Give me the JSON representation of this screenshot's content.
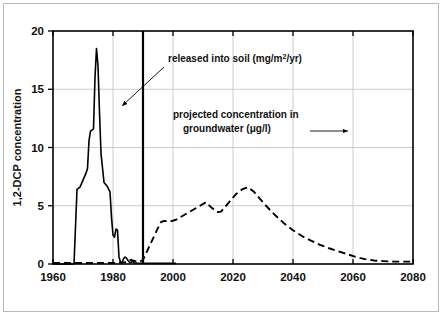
{
  "figure": {
    "background_color": "#ffffff",
    "frame_color": "#b9b9b9",
    "plot_border_color": "#000000",
    "grid_color": "#bfbfbf",
    "series_color": "#000000"
  },
  "chart_data": {
    "type": "line",
    "title": "",
    "xlabel": "",
    "ylabel": "1,2-DCP concentration",
    "xlim": [
      1960,
      2080
    ],
    "ylim": [
      0,
      20
    ],
    "xticks": [
      1960,
      1980,
      2000,
      2020,
      2040,
      2060,
      2080
    ],
    "xtick_labels": [
      "1960",
      "1980",
      "2000",
      "2020",
      "2040",
      "2060",
      "2080"
    ],
    "yticks": [
      0,
      5,
      10,
      15,
      20
    ],
    "ytick_labels": [
      "0",
      "5",
      "10",
      "15",
      "20"
    ],
    "grid": true,
    "grid_axis": "both",
    "legend": "none",
    "series": [
      {
        "name": "released into soil (mg/m2/yr)",
        "style": "solid",
        "linewidth": 1.6,
        "x": [
          1960,
          1966.5,
          1967,
          1967.5,
          1968,
          1969,
          1970,
          1971,
          1971.5,
          1972,
          1972.5,
          1973,
          1973.5,
          1974,
          1974.5,
          1975,
          1975.5,
          1976,
          1977,
          1978,
          1979,
          1979.5,
          1980,
          1980.5,
          1981,
          1981.5,
          1982,
          1982.5,
          1983,
          1983.5,
          1984,
          1984.5,
          1985,
          1985.5,
          1986,
          1986.5,
          1987,
          1988,
          1990,
          1995,
          2000,
          2001
        ],
        "y": [
          0,
          0,
          0,
          3.2,
          6.4,
          6.6,
          7.2,
          7.8,
          8.2,
          10.6,
          11.4,
          11.5,
          11.6,
          16.0,
          18.5,
          17.0,
          13.0,
          9.5,
          7.0,
          6.7,
          6.2,
          4.0,
          2.5,
          2.3,
          3.0,
          2.9,
          0.6,
          0.15,
          0.1,
          0.45,
          0.6,
          0.5,
          0.3,
          0.15,
          0.1,
          0.25,
          0.1,
          0.08,
          0.06,
          0.05,
          0.05,
          0.05
        ]
      },
      {
        "name": "projected concentration in groundwater (ug/l)",
        "style": "dashed",
        "linewidth": 1.9,
        "dash_pattern": "7,4",
        "x": [
          1960,
          1980,
          1984,
          1986,
          1988,
          1989,
          1990,
          1991,
          1993,
          1995,
          1996,
          1997,
          1999,
          2001,
          2003,
          2005,
          2007,
          2009,
          2011,
          2013,
          2015,
          2016,
          2017,
          2019,
          2021,
          2023,
          2025,
          2027,
          2029,
          2031,
          2034,
          2037,
          2040,
          2043,
          2046,
          2049,
          2052,
          2055,
          2058,
          2061,
          2064,
          2067,
          2070,
          2074,
          2078,
          2080
        ],
        "y": [
          0.08,
          0.08,
          0.15,
          0.35,
          0.2,
          0.2,
          0.35,
          0.9,
          2.0,
          3.1,
          3.6,
          3.7,
          3.65,
          3.8,
          4.1,
          4.4,
          4.7,
          5.0,
          5.3,
          4.8,
          4.45,
          4.5,
          4.8,
          5.4,
          6.0,
          6.4,
          6.6,
          6.2,
          5.6,
          5.0,
          4.2,
          3.5,
          2.9,
          2.4,
          2.0,
          1.65,
          1.35,
          1.1,
          0.85,
          0.6,
          0.42,
          0.3,
          0.25,
          0.2,
          0.2,
          0.2
        ]
      }
    ],
    "annotations": [
      {
        "id": "released-into-soil",
        "text": "released into soil (mg/m",
        "superscript": "2",
        "text_tail": "/yr)",
        "text_full": "released into soil (mg/m2/yr)",
        "text_x": 168,
        "text_y": 62,
        "arrow": {
          "x1": 164,
          "y1": 67,
          "x2": 122,
          "y2": 106,
          "head": "at-end"
        }
      },
      {
        "id": "projected-concentration-groundwater",
        "line1": "projected concentration in",
        "line2_prefix": "groundwater (",
        "line2_mu": "μ",
        "line2_suffix": "g/l)",
        "text_full": "projected concentration in groundwater (μg/l)",
        "text_x": 173,
        "text_y": 118,
        "line2_y": 132,
        "arrow": {
          "x1": 310,
          "y1": 131,
          "x2": 348,
          "y2": 131,
          "head": "at-end"
        }
      }
    ],
    "divider_line": {
      "id": "present-day-divider",
      "x_value": 1990,
      "y_from": 0,
      "y_to": 20,
      "linewidth": 2.2,
      "color": "#000000"
    }
  }
}
